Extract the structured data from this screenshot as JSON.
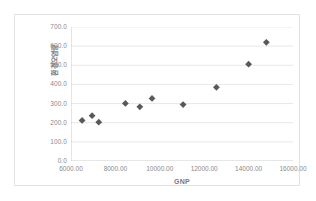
{
  "chart_data": {
    "type": "scatter",
    "title": "",
    "xlabel": "GNP",
    "ylabel": "환경오염량",
    "xlim": [
      6000,
      16000
    ],
    "ylim": [
      0,
      700
    ],
    "grid": true,
    "legend": false,
    "x_ticks": [
      "6000.00",
      "8000.00",
      "10000.00",
      "12000.00",
      "14000.00",
      "16000.00"
    ],
    "x_tick_values": [
      6000,
      8000,
      10000,
      12000,
      14000,
      16000
    ],
    "y_ticks": [
      "700.0",
      "600.0",
      "500.0",
      "400.0",
      "300.0",
      "200.0",
      "100.0",
      "0.0"
    ],
    "y_tick_values": [
      700,
      600,
      500,
      400,
      300,
      200,
      100,
      0
    ],
    "marker": {
      "shape": "diamond",
      "color": "#595959",
      "size": 3.4
    },
    "gridline_color": "#d9d9d9",
    "axis_color": "#bfbfbf",
    "label_color": "#8a8a8a",
    "points": [
      {
        "x": 6500,
        "y": 212
      },
      {
        "x": 6950,
        "y": 237
      },
      {
        "x": 7250,
        "y": 203
      },
      {
        "x": 8450,
        "y": 301
      },
      {
        "x": 9100,
        "y": 283
      },
      {
        "x": 9650,
        "y": 327
      },
      {
        "x": 11050,
        "y": 295
      },
      {
        "x": 12550,
        "y": 385
      },
      {
        "x": 14000,
        "y": 506
      },
      {
        "x": 14800,
        "y": 620
      }
    ]
  }
}
